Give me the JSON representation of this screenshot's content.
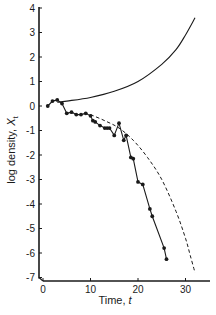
{
  "chart_data": {
    "type": "line",
    "title": "",
    "xlabel": "Time, t",
    "ylabel": "log density, X_t",
    "xlim": [
      0,
      34
    ],
    "ylim": [
      -7,
      4
    ],
    "grid": false,
    "legend": null,
    "x_ticks": [
      0,
      10,
      20,
      30
    ],
    "y_ticks": [
      4,
      3,
      2,
      1,
      0,
      -1,
      -2,
      -3,
      -4,
      -5,
      -6,
      -7
    ],
    "series": [
      {
        "name": "observed",
        "style": "solid-with-markers",
        "x": [
          1,
          2,
          3,
          4,
          5,
          6,
          7,
          8,
          9,
          10,
          10.5,
          11,
          12,
          13,
          13.5,
          14,
          15,
          16,
          17,
          17.5,
          18.5,
          19,
          20,
          21,
          22.5,
          23,
          25.5,
          26
        ],
        "y": [
          0.0,
          0.2,
          0.25,
          0.1,
          -0.3,
          -0.25,
          -0.35,
          -0.35,
          -0.3,
          -0.4,
          -0.6,
          -0.65,
          -0.8,
          -0.9,
          -0.9,
          -0.9,
          -1.2,
          -0.7,
          -1.4,
          -1.2,
          -2.1,
          -2.15,
          -3.1,
          -3.2,
          -4.2,
          -4.5,
          -5.8,
          -6.25
        ]
      },
      {
        "name": "upper-curve",
        "style": "solid",
        "x": [
          3,
          5,
          10,
          15,
          20,
          25,
          28,
          30,
          32
        ],
        "y": [
          0.15,
          0.2,
          0.35,
          0.6,
          1.0,
          1.7,
          2.3,
          2.9,
          3.6
        ]
      },
      {
        "name": "lower-curve",
        "style": "dashed",
        "x": [
          10,
          13,
          16,
          19,
          22,
          25,
          28,
          30,
          31,
          32
        ],
        "y": [
          -0.35,
          -0.6,
          -0.9,
          -1.4,
          -2.1,
          -3.0,
          -4.3,
          -5.4,
          -6.1,
          -6.8
        ]
      }
    ]
  },
  "labels": {
    "xlabel_text": "Time, ",
    "xlabel_var": "t",
    "ylabel_text": "log density, ",
    "ylabel_var": "X",
    "ylabel_sub": "t"
  }
}
